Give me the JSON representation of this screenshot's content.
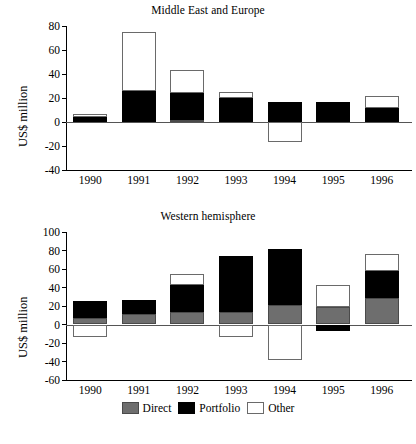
{
  "figure": {
    "ylabel": "US$ million",
    "legend": [
      {
        "key": "direct",
        "label": "Direct",
        "color": "#6e6e6e"
      },
      {
        "key": "portfolio",
        "label": "Portfolio",
        "color": "#000000"
      },
      {
        "key": "other",
        "label": "Other",
        "color": "#ffffff"
      }
    ]
  },
  "chart_data": [
    {
      "type": "bar",
      "stacked": true,
      "title": "Middle East and Europe",
      "xlabel": "",
      "ylabel": "US$ million",
      "categories": [
        "1990",
        "1991",
        "1992",
        "1993",
        "1994",
        "1995",
        "1996"
      ],
      "yticks": [
        80,
        60,
        40,
        20,
        0,
        -20,
        -40
      ],
      "ylim": [
        -40,
        80
      ],
      "grid": false,
      "legend_position": "bottom",
      "series": [
        {
          "name": "Direct",
          "color": "#6e6e6e",
          "values": [
            0,
            0,
            2,
            0,
            0,
            0,
            0
          ]
        },
        {
          "name": "Portfolio",
          "color": "#000000",
          "values": [
            4,
            26,
            22,
            20,
            17,
            17,
            12
          ]
        },
        {
          "name": "Other",
          "color": "#ffffff",
          "values": [
            3,
            49,
            19,
            5,
            -17,
            0,
            10
          ]
        }
      ]
    },
    {
      "type": "bar",
      "stacked": true,
      "title": "Western hemisphere",
      "xlabel": "",
      "ylabel": "US$ million",
      "categories": [
        "1990",
        "1991",
        "1992",
        "1993",
        "1994",
        "1995",
        "1996"
      ],
      "yticks": [
        100,
        80,
        60,
        40,
        20,
        0,
        -20,
        -40,
        -60
      ],
      "ylim": [
        -60,
        100
      ],
      "grid": false,
      "legend_position": "bottom",
      "series": [
        {
          "name": "Direct",
          "color": "#6e6e6e",
          "values": [
            7,
            11,
            13,
            13,
            21,
            19,
            29
          ]
        },
        {
          "name": "Portfolio",
          "color": "#000000",
          "values": [
            18,
            15,
            30,
            61,
            61,
            -7,
            29
          ]
        },
        {
          "name": "Other",
          "color": "#ffffff",
          "values": [
            -13,
            0,
            12,
            -13,
            -38,
            24,
            18
          ]
        }
      ]
    }
  ]
}
